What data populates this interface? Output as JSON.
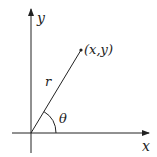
{
  "diagram": {
    "labels": {
      "x_axis": "x",
      "y_axis": "y",
      "point": "(x,y)",
      "radius": "r",
      "angle": "θ"
    },
    "colors": {
      "stroke": "#222222",
      "background": "#ffffff"
    }
  }
}
